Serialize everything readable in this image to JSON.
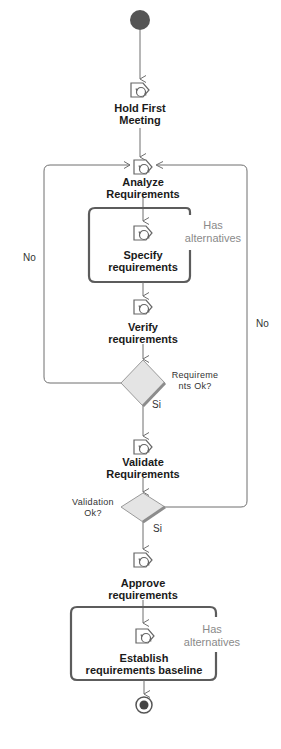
{
  "diagram": {
    "type": "activity",
    "start_node": {
      "label": ""
    },
    "end_node": {
      "label": ""
    },
    "activities": [
      {
        "id": "hold_first_meeting",
        "line1": "Hold First",
        "line2": "Meeting"
      },
      {
        "id": "analyze_requirements",
        "line1": "Analyze",
        "line2": "Requirements"
      },
      {
        "id": "specify_requirements",
        "line1": "Specify",
        "line2": "requirements"
      },
      {
        "id": "verify_requirements",
        "line1": "Verify",
        "line2": "requirements"
      },
      {
        "id": "validate_requirements",
        "line1": "Validate",
        "line2": "Requirements"
      },
      {
        "id": "approve_requirements",
        "line1": "Approve",
        "line2": "requirements"
      },
      {
        "id": "establish_baseline",
        "line1": "Establish",
        "line2": "requirements baseline"
      }
    ],
    "alternatives_groups": [
      {
        "line1": "Has",
        "line2": "alternatives"
      },
      {
        "line1": "Has",
        "line2": "alternatives"
      }
    ],
    "decisions": [
      {
        "id": "requirements_ok",
        "line1": "Requireme",
        "line2": "nts Ok?",
        "yes_label": "Si",
        "no_label": "No"
      },
      {
        "id": "validation_ok",
        "line1": "Validation",
        "line2": "Ok?",
        "yes_label": "Si",
        "no_label": "No"
      }
    ],
    "colors": {
      "line": "#6e6e6e",
      "node_fill": "#555555",
      "diamond_fill": "#e4e4e4",
      "diamond_shadow": "#8c8c8c",
      "alt_text": "#8a8a8a"
    }
  }
}
